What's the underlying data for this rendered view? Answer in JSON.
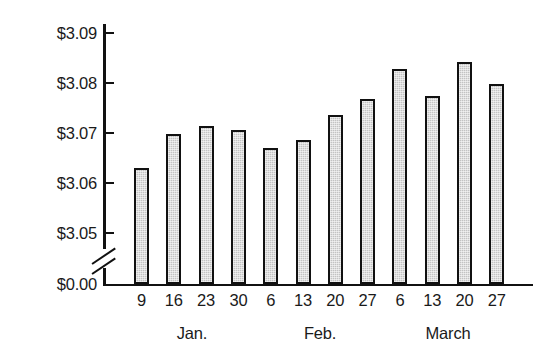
{
  "chart_data": {
    "type": "bar",
    "title": "",
    "subtitle": "",
    "xlabel": "",
    "ylabel": "",
    "categories": [
      "9",
      "16",
      "23",
      "30",
      "6",
      "13",
      "20",
      "27",
      "6",
      "13",
      "20",
      "27"
    ],
    "values": [
      3.063,
      3.07,
      3.0715,
      3.0707,
      3.067,
      3.0686,
      3.0737,
      3.077,
      3.083,
      3.0776,
      3.0845,
      3.08
    ],
    "ylim": [
      3.045,
      3.0925
    ],
    "y_axis_break": true,
    "y_axis_break_between": [
      "$0.00",
      "$3.05"
    ],
    "ytick_labels": [
      "$3.09",
      "$3.08",
      "$3.07",
      "$3.06",
      "$3.05",
      "$0.00"
    ],
    "ytick_values": [
      3.09,
      3.08,
      3.07,
      3.06,
      3.05,
      0.0
    ],
    "group_labels": [
      "Jan.",
      "Feb.",
      "March"
    ],
    "group_spans": [
      [
        0,
        3
      ],
      [
        4,
        7
      ],
      [
        8,
        11
      ]
    ],
    "grid": false,
    "legend": null,
    "bar_fill_color": "#c3c3c3",
    "bar_border_color": "#111111",
    "axis_color": "#111111",
    "background_color": "#ffffff"
  },
  "axis": {
    "yticks": [
      {
        "label": "$3.09",
        "y": 33
      },
      {
        "label": "$3.08",
        "y": 83
      },
      {
        "label": "$3.07",
        "y": 133
      },
      {
        "label": "$3.06",
        "y": 183
      },
      {
        "label": "$3.05",
        "y": 233
      },
      {
        "label": "$0.00",
        "y": 284
      }
    ]
  },
  "months": [
    {
      "label": "Jan."
    },
    {
      "label": "Feb."
    },
    {
      "label": "March"
    }
  ]
}
